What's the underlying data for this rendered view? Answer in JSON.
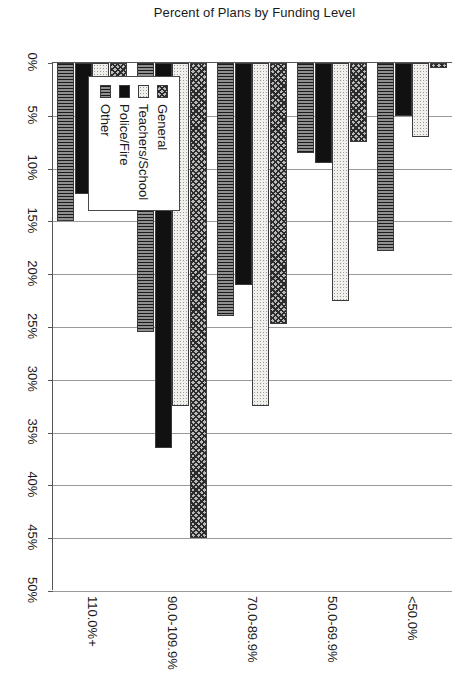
{
  "chart_data": {
    "type": "bar",
    "orientation": "vertical-rendered-rotated",
    "title": "",
    "xlabel": "",
    "ylabel": "Percent of Plans by Funding Level",
    "categories": [
      "<50.0%",
      "50.0-69.9%",
      "70.0-89.9%",
      "90.0-109.9%",
      "110.0%+"
    ],
    "series": [
      {
        "name": "General",
        "values": [
          0.5,
          7.5,
          24.7,
          45.0,
          12.5
        ]
      },
      {
        "name": "Teachers/School",
        "values": [
          7.0,
          22.5,
          32.5,
          32.5,
          2.0
        ]
      },
      {
        "name": "Police/Fire",
        "values": [
          5.0,
          9.5,
          21.0,
          36.5,
          12.4
        ]
      },
      {
        "name": "Other",
        "values": [
          17.8,
          8.5,
          24.0,
          25.5,
          15.0
        ]
      }
    ],
    "ylim": [
      0,
      50
    ],
    "ytick_labels": [
      "0%",
      "5%",
      "10%",
      "15%",
      "20%",
      "25%",
      "30%",
      "35%",
      "40%",
      "45%",
      "50%"
    ],
    "ytick_values": [
      0,
      5,
      10,
      15,
      20,
      25,
      30,
      35,
      40,
      45,
      50
    ],
    "grid": true,
    "legend_position": "inside-left",
    "colors": {
      "General": "#b9b9b9",
      "Teachers/School": "#f0efec",
      "Police/Fire": "#111111",
      "Other": "#8f8f8f",
      "axis": "#555555",
      "gridline": "#9a9a9a",
      "text": "#1a1a1a"
    },
    "patterns": {
      "General": "diagonal-crosshatch",
      "Teachers/School": "fine-dots",
      "Police/Fire": "solid-black",
      "Other": "vertical-lines"
    }
  },
  "legend": {
    "items": [
      {
        "label": "General",
        "pattern": "p-general"
      },
      {
        "label": "Teachers/School",
        "pattern": "p-teachers"
      },
      {
        "label": "Police/Fire",
        "pattern": "p-police"
      },
      {
        "label": "Other",
        "pattern": "p-other"
      }
    ]
  }
}
